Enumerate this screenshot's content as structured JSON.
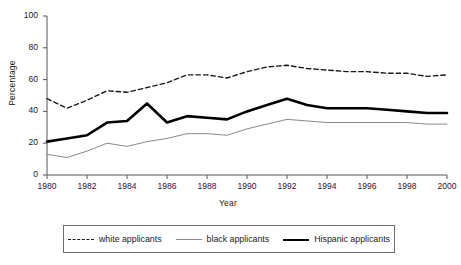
{
  "chart_data": {
    "type": "line",
    "title": "",
    "xlabel": "Year",
    "ylabel": "Percentage",
    "xlim": [
      1980,
      2000
    ],
    "ylim": [
      0,
      100
    ],
    "grid": false,
    "legend_position": "bottom",
    "xticks": [
      "1980",
      "1982",
      "1984",
      "1986",
      "1988",
      "1990",
      "1992",
      "1994",
      "1996",
      "1998",
      "2000"
    ],
    "yticks": [
      "0",
      "20",
      "40",
      "60",
      "80",
      "100"
    ],
    "x": [
      1980,
      1981,
      1982,
      1983,
      1984,
      1985,
      1986,
      1987,
      1988,
      1989,
      1990,
      1991,
      1992,
      1993,
      1994,
      1995,
      1996,
      1997,
      1998,
      1999,
      2000
    ],
    "series": [
      {
        "name": "white applicants",
        "style": "dashed",
        "color": "#1a1a1a",
        "width": 1.4,
        "values": [
          48,
          42,
          47,
          53,
          52,
          55,
          58,
          63,
          63,
          61,
          65,
          68,
          69,
          67,
          66,
          65,
          65,
          64,
          64,
          62,
          63
        ]
      },
      {
        "name": "black applicants",
        "style": "solid-thin",
        "color": "#8a8a8a",
        "width": 1,
        "values": [
          13,
          11,
          15,
          20,
          18,
          21,
          23,
          26,
          26,
          25,
          29,
          32,
          35,
          34,
          33,
          33,
          33,
          33,
          33,
          32,
          32
        ]
      },
      {
        "name": "Hispanic applicants",
        "style": "solid-thick",
        "color": "#000000",
        "width": 2.6,
        "values": [
          21,
          23,
          25,
          33,
          34,
          45,
          33,
          37,
          36,
          35,
          40,
          44,
          48,
          44,
          42,
          42,
          42,
          41,
          40,
          39,
          39
        ]
      }
    ]
  },
  "legend": {
    "items": [
      {
        "label": "white applicants"
      },
      {
        "label": "black applicants"
      },
      {
        "label": "Hispanic applicants"
      }
    ]
  }
}
